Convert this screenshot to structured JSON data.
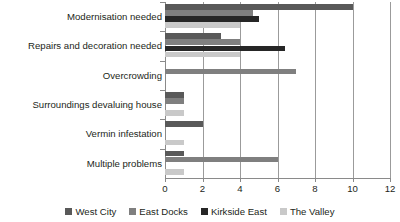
{
  "chart_data": {
    "type": "bar",
    "orientation": "horizontal",
    "title": "",
    "xlabel": "",
    "ylabel": "",
    "xlim": [
      0,
      12
    ],
    "xticks": [
      0,
      2,
      4,
      6,
      8,
      10,
      12
    ],
    "xtick_labels": [
      "0",
      "2",
      "4",
      "6",
      "8",
      "10",
      "12"
    ],
    "grid": true,
    "grid_axis": "x",
    "legend_position": "bottom",
    "categories": [
      "Modernisation needed",
      "Repairs and decoration needed",
      "Overcrowding",
      "Surroundings devaluing house",
      "Vermin infestation",
      "Multiple problems"
    ],
    "series": [
      {
        "name": "West City",
        "color": "#595959",
        "values": [
          10,
          3,
          0,
          1,
          2,
          1
        ]
      },
      {
        "name": "East Docks",
        "color": "#7f7f7f",
        "values": [
          4.7,
          4,
          7,
          1,
          0,
          6
        ]
      },
      {
        "name": "Kirkside East",
        "color": "#262626",
        "values": [
          5,
          6.4,
          0,
          0,
          0,
          0
        ]
      },
      {
        "name": "The Valley",
        "color": "#c9c9c9",
        "values": [
          4,
          4,
          0,
          1,
          1,
          1
        ]
      }
    ]
  },
  "colors": {
    "axis": "#8a8a8a",
    "gridline": "#9b9b9b",
    "text": "#231f20",
    "background": "#ffffff"
  }
}
